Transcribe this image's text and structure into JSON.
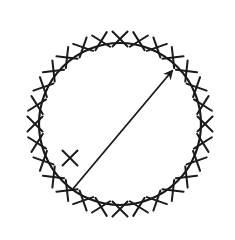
{
  "diagram": {
    "circle": {
      "cx": 120,
      "cy": 124,
      "r": 81,
      "stroke": "#1a1a1a",
      "stroke_width": 2.2
    },
    "boundary_marks": {
      "symbol": "X",
      "count": 28,
      "radius_offset": 4,
      "size": 10,
      "stroke_width": 2
    },
    "interior_mark": {
      "symbol": "X",
      "x": 70,
      "y": 158,
      "size": 10
    },
    "arrow": {
      "x1": 72,
      "y1": 190,
      "x2": 172,
      "y2": 71,
      "stroke_width": 1.8,
      "head": "filled"
    },
    "colors": {
      "ink": "#1a1a1a",
      "background": "#ffffff"
    }
  }
}
